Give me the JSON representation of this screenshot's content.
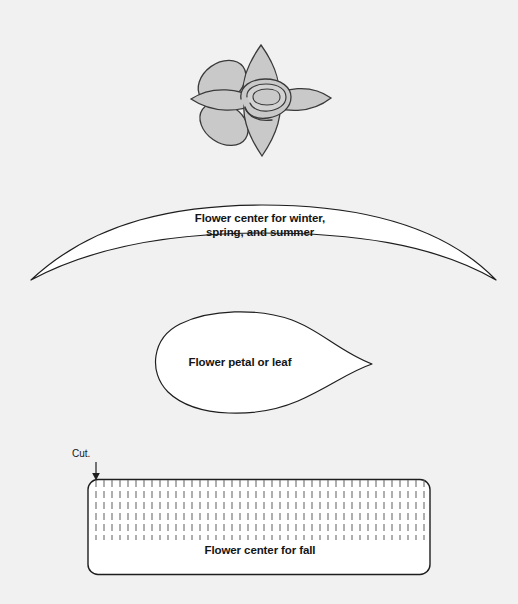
{
  "page": {
    "background_color": "#f1f1f1"
  },
  "figures": {
    "flower": {
      "name": "assembled-flower-illustration",
      "petal_fill": "#c9c9c9",
      "outline_color": "#3a3a3a",
      "petal_count": 6
    },
    "crescent": {
      "label": "Flower center for winter,\nspring, and summer",
      "fill": "#ffffff",
      "outline_color": "#1e1e1e"
    },
    "petal": {
      "label": "Flower petal or leaf",
      "fill": "#ffffff",
      "outline_color": "#1e1e1e"
    },
    "fringe": {
      "label": "Flower center for fall",
      "cut_label": "Cut.",
      "fill": "#ffffff",
      "outline_color": "#1e1e1e",
      "fringe_line_color": "#6e6e6e",
      "fringe_line_count": 42
    }
  }
}
